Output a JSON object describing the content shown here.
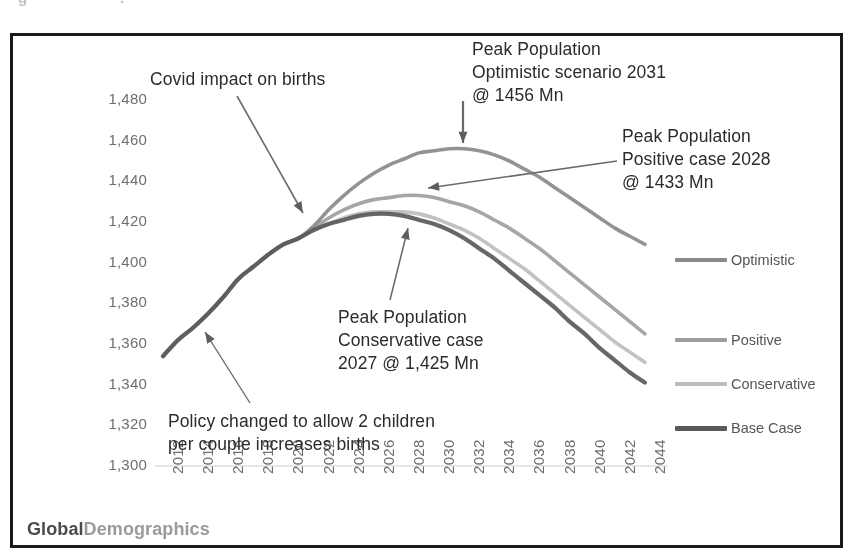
{
  "top_remnant": [
    {
      "text": "g",
      "left": 18
    },
    {
      "text": ".",
      "left": 120
    },
    {
      "text": "•",
      "left": 206
    },
    {
      "text": "·",
      "left": 410
    }
  ],
  "watermark": {
    "part1": "Global",
    "part2": "Demographics"
  },
  "axis": {
    "y_title": "Total Population - mns",
    "y_ticks": [
      "1,480",
      "1,460",
      "1,440",
      "1,420",
      "1,400",
      "1,380",
      "1,360",
      "1,340",
      "1,320",
      "1,300"
    ],
    "x_ticks": [
      "2012",
      "2014",
      "2016",
      "2018",
      "2020",
      "2022",
      "2024",
      "2026",
      "2028",
      "2030",
      "2032",
      "2034",
      "2036",
      "2038",
      "2040",
      "2042",
      "2044"
    ]
  },
  "legend": [
    {
      "label": "Optimistic",
      "color": "#8a8a8a",
      "width": 4
    },
    {
      "label": "Positive",
      "color": "#9e9e9e",
      "width": 4
    },
    {
      "label": "Conservative",
      "color": "#bdbdbd",
      "width": 4
    },
    {
      "label": "Base Case",
      "color": "#5a5a5a",
      "width": 5
    }
  ],
  "annotations": [
    {
      "id": "covid",
      "lines": [
        "Covid impact on births"
      ],
      "left": 150,
      "top": 68
    },
    {
      "id": "optimistic",
      "lines": [
        "Peak Population",
        "Optimistic scenario  2031",
        "@ 1456 Mn"
      ],
      "left": 472,
      "top": 38
    },
    {
      "id": "positive",
      "lines": [
        "Peak Population",
        "Positive case 2028",
        "@ 1433 Mn"
      ],
      "left": 622,
      "top": 125
    },
    {
      "id": "conservative",
      "lines": [
        "Peak Population",
        "Conservative case",
        "2027 @ 1,425 Mn"
      ],
      "left": 338,
      "top": 306
    },
    {
      "id": "policy",
      "lines": [
        "Policy changed to allow 2 children",
        "per couple increases births"
      ],
      "left": 168,
      "top": 410
    }
  ],
  "chart_data": {
    "type": "line",
    "title": "",
    "xlabel": "",
    "ylabel": "Total Population - mns",
    "xlim": [
      2012,
      2045
    ],
    "ylim": [
      1300,
      1480
    ],
    "ytick_step": 20,
    "xtick_step": 2,
    "grid": false,
    "legend_position": "right",
    "x": [
      2012,
      2013,
      2014,
      2015,
      2016,
      2017,
      2018,
      2019,
      2020,
      2021,
      2022,
      2023,
      2024,
      2025,
      2026,
      2027,
      2028,
      2029,
      2030,
      2031,
      2032,
      2033,
      2034,
      2035,
      2036,
      2037,
      2038,
      2039,
      2040,
      2041,
      2042,
      2043,
      2044
    ],
    "series": [
      {
        "name": "Optimistic",
        "color": "#8a8a8a",
        "peak_year": 2031,
        "peak_value": 1456,
        "values": [
          1354,
          1362,
          1368,
          1375,
          1383,
          1392,
          1398,
          1404,
          1409,
          1412,
          1418,
          1426,
          1433,
          1439,
          1444,
          1448,
          1451,
          1454,
          1455,
          1456,
          1456,
          1455,
          1453,
          1450,
          1446,
          1442,
          1437,
          1432,
          1427,
          1422,
          1417,
          1413,
          1409
        ]
      },
      {
        "name": "Positive",
        "color": "#9e9e9e",
        "peak_year": 2028,
        "peak_value": 1433,
        "values": [
          1354,
          1362,
          1368,
          1375,
          1383,
          1392,
          1398,
          1404,
          1409,
          1412,
          1417,
          1422,
          1426,
          1429,
          1431,
          1432,
          1433,
          1433,
          1432,
          1430,
          1428,
          1425,
          1421,
          1417,
          1412,
          1407,
          1401,
          1395,
          1389,
          1383,
          1377,
          1371,
          1365
        ]
      },
      {
        "name": "Conservative",
        "color": "#bdbdbd",
        "peak_year": 2027,
        "peak_value": 1425,
        "values": [
          1354,
          1362,
          1368,
          1375,
          1383,
          1392,
          1398,
          1404,
          1409,
          1412,
          1416,
          1419,
          1422,
          1424,
          1425,
          1425,
          1425,
          1424,
          1422,
          1419,
          1416,
          1412,
          1407,
          1402,
          1397,
          1391,
          1385,
          1379,
          1373,
          1367,
          1361,
          1356,
          1351
        ]
      },
      {
        "name": "Base Case",
        "color": "#5a5a5a",
        "peak_year": 2026,
        "peak_value": 1424,
        "values": [
          1354,
          1362,
          1368,
          1375,
          1383,
          1392,
          1398,
          1404,
          1409,
          1412,
          1416,
          1419,
          1421,
          1423,
          1424,
          1424,
          1423,
          1421,
          1419,
          1416,
          1412,
          1407,
          1402,
          1396,
          1390,
          1384,
          1378,
          1371,
          1365,
          1358,
          1352,
          1346,
          1341
        ]
      }
    ],
    "annotations": [
      {
        "text": "Covid impact on births",
        "points_to_year": 2021,
        "points_to_value": 1412
      },
      {
        "text": "Peak Population Optimistic scenario 2031 @ 1456 Mn",
        "points_to_year": 2031,
        "points_to_value": 1456
      },
      {
        "text": "Peak Population Positive case 2028 @ 1433 Mn",
        "points_to_year": 2028,
        "points_to_value": 1433
      },
      {
        "text": "Peak Population Conservative case 2027 @ 1,425 Mn",
        "points_to_year": 2026,
        "points_to_value": 1425
      },
      {
        "text": "Policy changed to allow 2 children per couple increases births",
        "points_to_year": 2015,
        "points_to_value": 1375
      }
    ]
  }
}
